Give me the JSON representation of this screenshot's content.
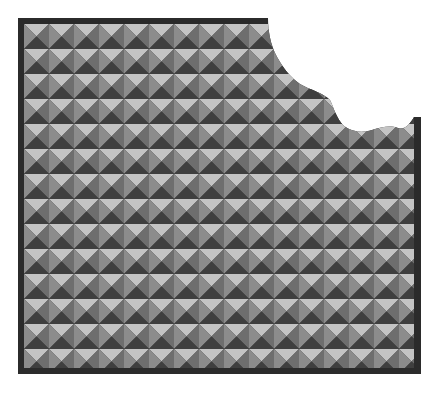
{
  "image": {
    "subject": "Bitten pyramid-stud textured tile panel",
    "description": "Square panel of repeating gray pyramid studs framed by a dark border, with a scalloped bite missing from the upper-right corner"
  },
  "panel": {
    "x": 18,
    "y": 18,
    "width": 403,
    "height": 356,
    "border_width": 6,
    "tile_size": 25,
    "colors": {
      "border": "#2b2b2b",
      "facet_top": "#c4c4c4",
      "facet_left": "#8c8c8c",
      "facet_right": "#6e6e6e",
      "facet_bottom": "#3f3f3f",
      "background": "#ffffff"
    }
  },
  "bite": {
    "location": "top-right",
    "shape": "scalloped"
  }
}
